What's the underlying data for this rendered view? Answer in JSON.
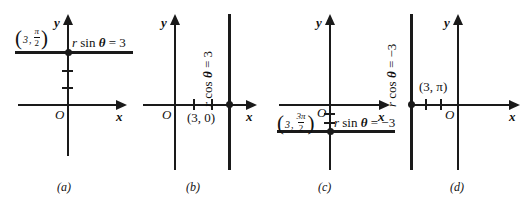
{
  "figure": {
    "kind": "polar-to-cartesian-line-graphs",
    "width": 529,
    "height": 207,
    "ink_color": "#1a1a1a",
    "background": "#ffffff"
  },
  "axis_labels": {
    "x": "x",
    "y": "y",
    "origin": "O"
  },
  "panels": [
    {
      "caption": "(a)",
      "equation_text": "r sin θ = 3",
      "equation_parts": {
        "r": "r",
        "fn": "sin",
        "theta": "θ",
        "eq": "=",
        "value": "3"
      },
      "point_label": {
        "r": "3",
        "separator": ",",
        "num": "π",
        "den": "2"
      },
      "line_type": "horizontal",
      "line_value": 3,
      "tick_values": [
        1,
        2
      ],
      "tick_axis": "y",
      "point_cartesian": [
        0,
        3
      ]
    },
    {
      "caption": "(b)",
      "equation_text": "r cos θ = 3",
      "equation_parts": {
        "r": "r",
        "fn": "cos",
        "theta": "θ",
        "eq": "=",
        "value": "3"
      },
      "point_label_plain": "(3, 0)",
      "line_type": "vertical",
      "line_value": 3,
      "tick_values": [
        1,
        2
      ],
      "tick_axis": "x",
      "point_cartesian": [
        3,
        0
      ]
    },
    {
      "caption": "(c)",
      "equation_text": "r sin θ = −3",
      "equation_parts": {
        "r": "r",
        "fn": "sin",
        "theta": "θ",
        "eq": "=",
        "value": "−3"
      },
      "point_label": {
        "r": "3",
        "separator": ",",
        "num": "3π",
        "den": "2"
      },
      "line_type": "horizontal",
      "line_value": -3,
      "tick_values": [
        -1,
        -2
      ],
      "tick_axis": "y",
      "point_cartesian": [
        0,
        -3
      ]
    },
    {
      "caption": "(d)",
      "equation_text": "r cos θ = −3",
      "equation_parts": {
        "r": "r",
        "fn": "cos",
        "theta": "θ",
        "eq": "=",
        "value": "−3"
      },
      "point_label_plain": "(3, π)",
      "line_type": "vertical",
      "line_value": -3,
      "tick_values": [
        -1,
        -2
      ],
      "tick_axis": "x",
      "point_cartesian": [
        -3,
        0
      ]
    }
  ]
}
